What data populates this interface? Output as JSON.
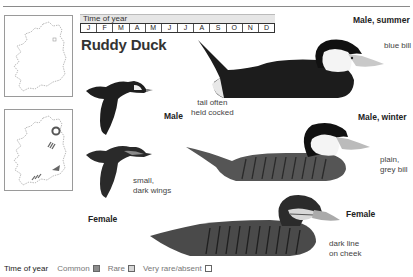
{
  "time_of_year": {
    "label": "Time of year",
    "months": [
      "J",
      "F",
      "M",
      "A",
      "M",
      "J",
      "J",
      "A",
      "S",
      "O",
      "N",
      "D"
    ]
  },
  "species": {
    "title": "Ruddy Duck"
  },
  "maps": [
    {
      "name": "breeding-map",
      "markers": []
    },
    {
      "name": "wintering-map",
      "markers": [
        "ring",
        "hatched",
        "solid",
        "hatched"
      ]
    }
  ],
  "illustrations": {
    "male_summer": {
      "label": "Male, summer",
      "note": "blue bill"
    },
    "male_winter": {
      "label": "Male, winter",
      "note_line1": "plain,",
      "note_line2": "grey bill"
    },
    "female": {
      "label": "Female",
      "note_line1": "dark line",
      "note_line2": "on cheek"
    },
    "tail_note": {
      "line1": "tail often",
      "line2": "held cocked"
    },
    "flight_male": {
      "label": "Male"
    },
    "flight_female": {
      "label": "Female",
      "note_line1": "small,",
      "note_line2": "dark wings"
    }
  },
  "legend": {
    "title": "Time of year",
    "items": [
      {
        "label": "Common",
        "color": "#8c8c8c"
      },
      {
        "label": "Rare",
        "color": "#d6d6d6"
      },
      {
        "label": "Very rare/absent",
        "color": "#ffffff"
      }
    ]
  }
}
